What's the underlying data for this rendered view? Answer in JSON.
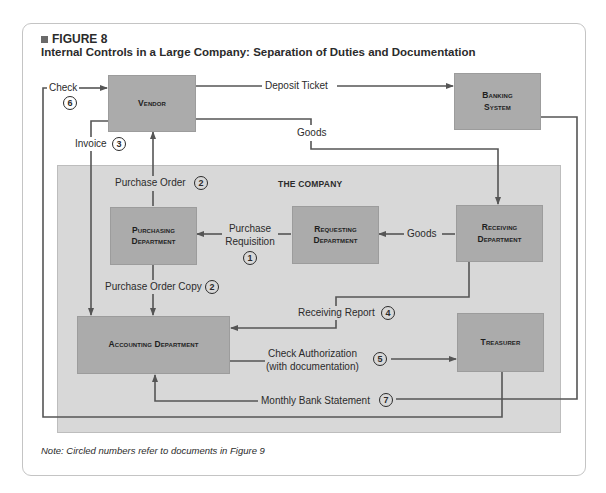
{
  "figure": {
    "label": "FIGURE 8",
    "title": "Internal Controls in a Large Company: Separation of Duties and Documentation",
    "note": "Note: Circled numbers refer to documents in Figure 9"
  },
  "company": {
    "label": "THE COMPANY"
  },
  "boxes": {
    "vendor": "Vendor",
    "banking_1": "Banking",
    "banking_2": "System",
    "purchasing_1": "Purchasing",
    "purchasing_2": "Department",
    "requesting_1": "Requesting",
    "requesting_2": "Department",
    "receiving_1": "Receiving",
    "receiving_2": "Department",
    "accounting": "Accounting Department",
    "treasurer": "Treasurer"
  },
  "flows": {
    "check": {
      "label": "Check",
      "num": "6"
    },
    "deposit_ticket": {
      "label": "Deposit Ticket"
    },
    "goods_vendor": {
      "label": "Goods"
    },
    "invoice": {
      "label": "Invoice",
      "num": "3"
    },
    "purchase_order": {
      "label": "Purchase Order",
      "num": "2"
    },
    "purchase_requisition": {
      "label_1": "Purchase",
      "label_2": "Requisition",
      "num": "1"
    },
    "goods_internal": {
      "label": "Goods"
    },
    "purchase_order_copy": {
      "label": "Purchase Order Copy",
      "num": "2"
    },
    "receiving_report": {
      "label": "Receiving Report",
      "num": "4"
    },
    "check_authorization": {
      "label_1": "Check Authorization",
      "label_2": "(with documentation)",
      "num": "5"
    },
    "monthly_bank_statement": {
      "label": "Monthly Bank Statement",
      "num": "7"
    }
  },
  "colors": {
    "box_fill": "#ababab",
    "company_fill": "#d8d8d8",
    "line": "#555555",
    "background": "#ffffff"
  }
}
